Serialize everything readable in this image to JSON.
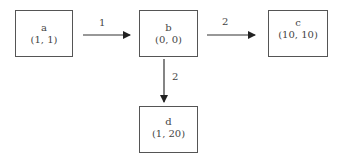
{
  "nodes": [
    {
      "id": "a",
      "name": "a",
      "coords": "(1, 1)"
    },
    {
      "id": "b",
      "name": "b",
      "coords": "(0, 0)"
    },
    {
      "id": "c",
      "name": "c",
      "coords": "(10, 10)"
    },
    {
      "id": "d",
      "name": "d",
      "coords": "(1, 20)"
    }
  ],
  "edges": [
    {
      "from": "a",
      "to": "b",
      "label": "1"
    },
    {
      "from": "b",
      "to": "c",
      "label": "2"
    },
    {
      "from": "b",
      "to": "d",
      "label": "2"
    }
  ],
  "colors": {
    "stroke": "#555555",
    "text": "#444444"
  }
}
